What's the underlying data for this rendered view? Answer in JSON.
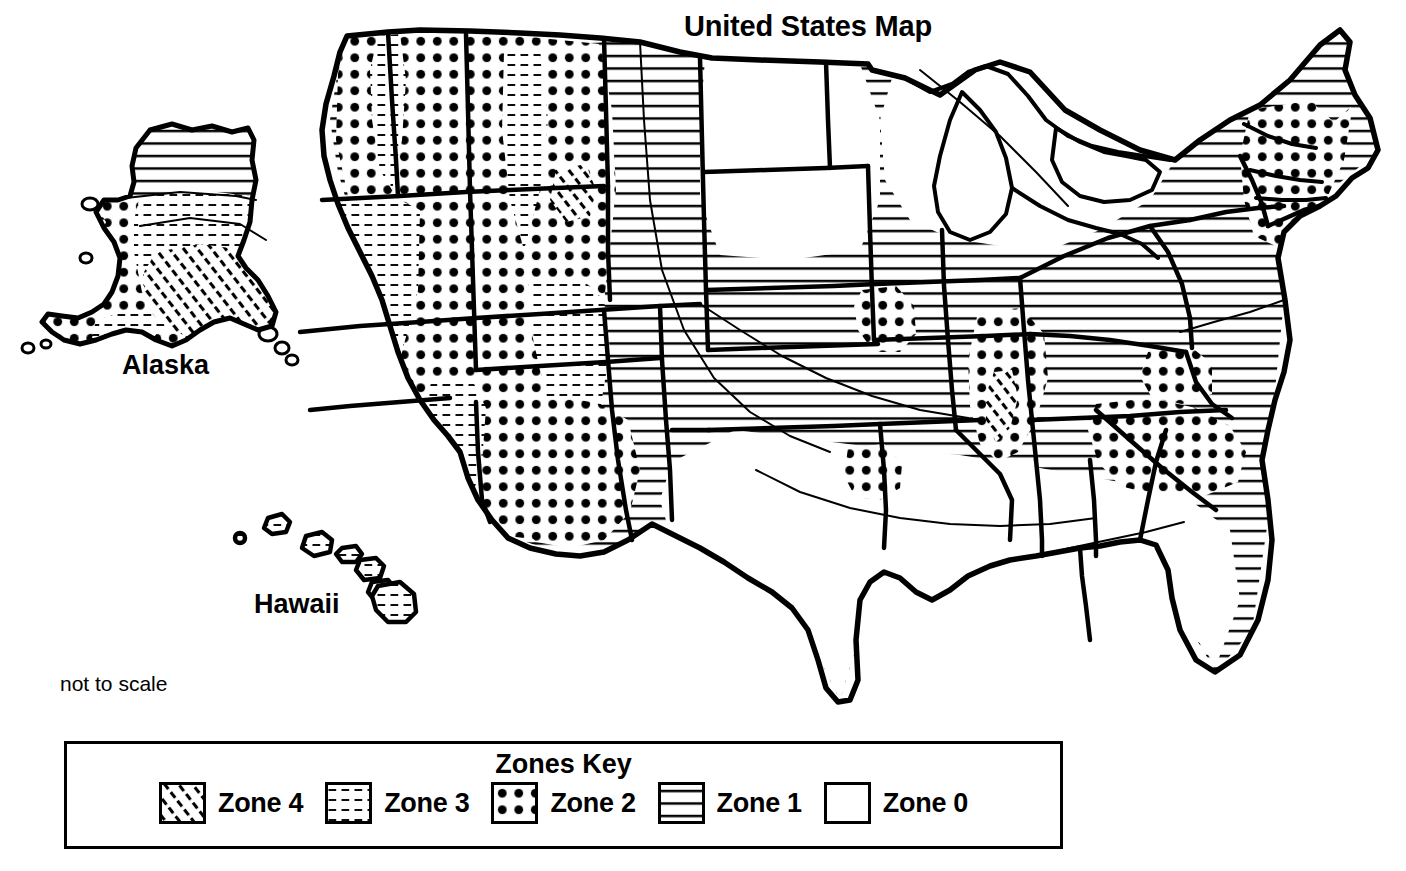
{
  "title": "United States Map",
  "labels": {
    "alaska": "Alaska",
    "hawaii": "Hawaii",
    "not_to_scale": "not to scale"
  },
  "legend": {
    "title": "Zones Key",
    "items": [
      {
        "label": "Zone 4",
        "pattern": "diagonal-hatch",
        "pattern_id": "zone4"
      },
      {
        "label": "Zone 3",
        "pattern": "fine-dashes",
        "pattern_id": "zone3"
      },
      {
        "label": "Zone 2",
        "pattern": "large-dots",
        "pattern_id": "zone2"
      },
      {
        "label": "Zone 1",
        "pattern": "horizontal-lines",
        "pattern_id": "zone1"
      },
      {
        "label": "Zone 0",
        "pattern": "blank-white",
        "pattern_id": "zone0"
      }
    ]
  },
  "colors": {
    "ink": "#000000",
    "paper": "#ffffff"
  },
  "map": {
    "zone_descriptions": {
      "zone4": "Highest seismic risk - diagonal hatching",
      "zone3": "High seismic risk - fine dash stipple",
      "zone2": "Moderate seismic risk - large dot grid",
      "zone1": "Low seismic risk - horizontal lines",
      "zone0": "No seismic risk - blank white"
    },
    "regions": [
      {
        "name": "pacific-northwest-washington",
        "zone": "zone2"
      },
      {
        "name": "puget-sound-corridor",
        "zone": "zone3"
      },
      {
        "name": "oregon-interior",
        "zone": "zone2"
      },
      {
        "name": "idaho-montana-wyoming",
        "zone": "zone2"
      },
      {
        "name": "nevada-utah-basin",
        "zone": "zone2"
      },
      {
        "name": "california-coast",
        "zone": "zone4"
      },
      {
        "name": "california-central-valley",
        "zone": "zone3"
      },
      {
        "name": "arizona-new-mexico-west",
        "zone": "zone2"
      },
      {
        "name": "colorado-plateau",
        "zone": "zone3"
      },
      {
        "name": "great-plains-west",
        "zone": "zone1"
      },
      {
        "name": "texas-main",
        "zone": "zone0"
      },
      {
        "name": "texas-panhandle",
        "zone": "zone1"
      },
      {
        "name": "great-lakes",
        "zone": "zone0"
      },
      {
        "name": "new-madrid-core",
        "zone": "zone4"
      },
      {
        "name": "new-madrid-outer",
        "zone": "zone2"
      },
      {
        "name": "midwest-plains",
        "zone": "zone1"
      },
      {
        "name": "appalachians",
        "zone": "zone1"
      },
      {
        "name": "charleston-south-carolina",
        "zone": "zone2"
      },
      {
        "name": "tennessee-valley",
        "zone": "zone2"
      },
      {
        "name": "new-england",
        "zone": "zone2"
      },
      {
        "name": "maine-north",
        "zone": "zone1"
      },
      {
        "name": "florida",
        "zone": "zone0"
      },
      {
        "name": "gulf-coast",
        "zone": "zone0"
      },
      {
        "name": "alaska-north",
        "zone": "zone1"
      },
      {
        "name": "alaska-west",
        "zone": "zone2"
      },
      {
        "name": "alaska-interior",
        "zone": "zone3"
      },
      {
        "name": "alaska-south-coast",
        "zone": "zone4"
      },
      {
        "name": "hawaii-islands",
        "zone": "zone3"
      }
    ]
  }
}
